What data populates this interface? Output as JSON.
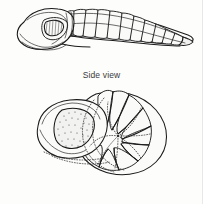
{
  "figure": {
    "background_color": "#fdfdfc",
    "ink_color": "#1a1a1a",
    "panels": [
      {
        "id": "side-view",
        "caption": "Side view",
        "subject": "trilobite-lateral-profile",
        "description": "Elongated segmented trilobite in lateral profile; cephalon with eye at left, thoracic segments arching to the right, pygidium tapering to a point."
      },
      {
        "id": "enrolled-specimen",
        "caption": "Enrolled Specimen",
        "subject": "trilobite-enrolled-coil",
        "description": "Trilobite rolled into a coil; stippled glabella at upper left, thoracic segments fanning clockwise into a scalloped outer margin, dotted lines marking hidden contours."
      }
    ],
    "icons": {
      "eye": "trilobite-eye-icon",
      "glabella": "glabella-icon"
    }
  }
}
